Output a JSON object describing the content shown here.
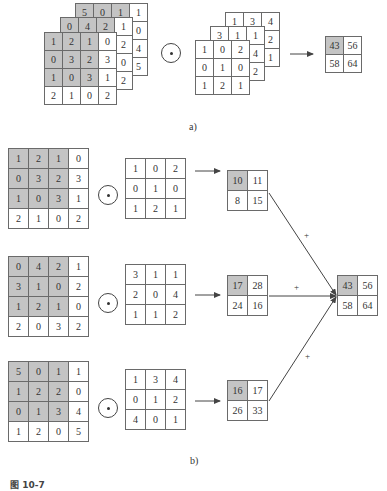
{
  "part_a": {
    "label": "a)",
    "input_layers": [
      {
        "rows": [
          [
            "5",
            "0",
            "1",
            "1"
          ],
          [
            "",
            "",
            "",
            "0"
          ],
          [
            "",
            "",
            "",
            "4"
          ],
          [
            "",
            "",
            "",
            "5"
          ]
        ]
      },
      {
        "rows": [
          [
            "0",
            "4",
            "2",
            "1"
          ],
          [
            "",
            "",
            "",
            "2"
          ],
          [
            "",
            "",
            "",
            "0"
          ],
          [
            "",
            "",
            "",
            "2"
          ]
        ]
      },
      {
        "rows": [
          [
            "1",
            "2",
            "1",
            "0"
          ],
          [
            "0",
            "3",
            "2",
            "3"
          ],
          [
            "1",
            "0",
            "3",
            "1"
          ],
          [
            "2",
            "1",
            "0",
            "2"
          ]
        ]
      }
    ],
    "operator": "⊙",
    "kernel_layers": [
      {
        "rows": [
          [
            "1",
            "3",
            "4"
          ],
          [
            "",
            "",
            "2"
          ],
          [
            "",
            "",
            "1"
          ]
        ]
      },
      {
        "rows": [
          [
            "3",
            "1",
            "1"
          ],
          [
            "",
            "",
            "4"
          ],
          [
            "",
            "",
            "2"
          ]
        ]
      },
      {
        "rows": [
          [
            "1",
            "0",
            "2"
          ],
          [
            "0",
            "1",
            "0"
          ],
          [
            "1",
            "2",
            "1"
          ]
        ]
      }
    ],
    "output": {
      "rows": [
        [
          "43",
          "56"
        ],
        [
          "58",
          "64"
        ]
      ]
    }
  },
  "part_b": {
    "label": "b)",
    "channels": [
      {
        "input": {
          "rows": [
            [
              "1",
              "2",
              "1",
              "0"
            ],
            [
              "0",
              "3",
              "2",
              "3"
            ],
            [
              "1",
              "0",
              "3",
              "1"
            ],
            [
              "2",
              "1",
              "0",
              "2"
            ]
          ]
        },
        "kernel": {
          "rows": [
            [
              "1",
              "0",
              "2"
            ],
            [
              "0",
              "1",
              "0"
            ],
            [
              "1",
              "2",
              "1"
            ]
          ]
        },
        "output": {
          "rows": [
            [
              "10",
              "11"
            ],
            [
              "8",
              "15"
            ]
          ]
        },
        "plus": "+"
      },
      {
        "input": {
          "rows": [
            [
              "0",
              "4",
              "2",
              "1"
            ],
            [
              "3",
              "1",
              "0",
              "2"
            ],
            [
              "1",
              "2",
              "1",
              "0"
            ],
            [
              "2",
              "0",
              "3",
              "2"
            ]
          ]
        },
        "kernel": {
          "rows": [
            [
              "3",
              "1",
              "1"
            ],
            [
              "2",
              "0",
              "4"
            ],
            [
              "1",
              "1",
              "2"
            ]
          ]
        },
        "output": {
          "rows": [
            [
              "17",
              "28"
            ],
            [
              "24",
              "16"
            ]
          ]
        },
        "plus": "+"
      },
      {
        "input": {
          "rows": [
            [
              "5",
              "0",
              "1",
              "1"
            ],
            [
              "1",
              "2",
              "2",
              "0"
            ],
            [
              "0",
              "1",
              "3",
              "4"
            ],
            [
              "1",
              "2",
              "0",
              "5"
            ]
          ]
        },
        "kernel": {
          "rows": [
            [
              "1",
              "3",
              "4"
            ],
            [
              "0",
              "1",
              "2"
            ],
            [
              "4",
              "0",
              "1"
            ]
          ]
        },
        "output": {
          "rows": [
            [
              "16",
              "17"
            ],
            [
              "26",
              "33"
            ]
          ]
        },
        "plus": "+"
      }
    ],
    "operator": "⊙",
    "sum_output": {
      "rows": [
        [
          "43",
          "56"
        ],
        [
          "58",
          "64"
        ]
      ]
    }
  },
  "caption": "图 10-7",
  "colors": {
    "shaded_cell": "#c4c4c4",
    "line": "#555555",
    "background": "#ffffff"
  }
}
